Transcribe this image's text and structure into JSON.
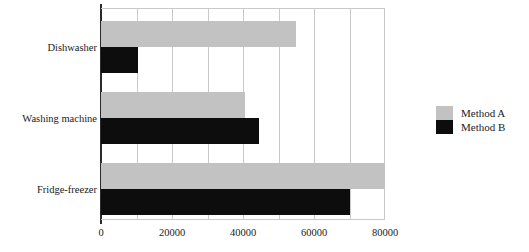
{
  "chart_data": {
    "type": "bar",
    "orientation": "horizontal",
    "title": "",
    "xlabel": "",
    "ylabel": "",
    "categories": [
      "Dishwasher",
      "Washing machine",
      "Fridge-freezer"
    ],
    "series": [
      {
        "name": "Method A",
        "color": "#c2c2c2",
        "values": [
          55000,
          40500,
          80000
        ]
      },
      {
        "name": "Method B",
        "color": "#0d0d0d",
        "values": [
          10500,
          44500,
          70000
        ]
      }
    ],
    "xlim": [
      0,
      80000
    ],
    "xticks": [
      0,
      20000,
      40000,
      60000,
      80000
    ],
    "xtick_labels": [
      "0",
      "20000",
      "40000",
      "60000",
      "80000"
    ],
    "gridline_values": [
      10000,
      20000,
      30000,
      40000,
      50000,
      60000,
      70000,
      80000
    ],
    "grid": true,
    "legend_position": "right",
    "legend_entries": [
      "Method A",
      "Method B"
    ]
  },
  "legend": {
    "items": [
      {
        "label": "Method A",
        "color": "#c2c2c2"
      },
      {
        "label": "Method B",
        "color": "#0d0d0d"
      }
    ]
  },
  "axis": {
    "categories": [
      "Dishwasher",
      "Washing machine",
      "Fridge-freezer"
    ],
    "xtick_labels": [
      "0",
      "20000",
      "40000",
      "60000",
      "80000"
    ]
  }
}
